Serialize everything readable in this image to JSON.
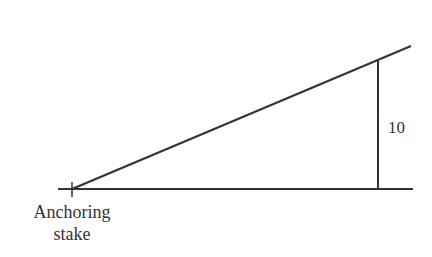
{
  "diagram": {
    "type": "right-triangle",
    "height_label": "10",
    "stake_label_line1": "Anchoring",
    "stake_label_line2": "stake",
    "colors": {
      "line": "#333333",
      "text": "#333333",
      "background": "#ffffff"
    }
  }
}
